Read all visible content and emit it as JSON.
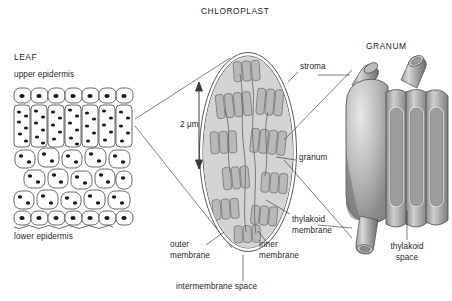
{
  "diagram": {
    "title_leaf": "LEAF",
    "title_chloroplast": "CHLOROPLAST",
    "title_granum": "GRANUM",
    "scale_label": "2 μm",
    "ink": "#1d1d1d",
    "fill_light": "#d9d9d9",
    "fill_mid": "#a8a8a8",
    "fill_dark": "#6e6e6e"
  },
  "leaf": {
    "upper_epidermis": "upper epidermis",
    "lower_epidermis": "lower epidermis"
  },
  "chloroplast": {
    "stroma": "stroma",
    "granum": "granum",
    "thylakoid_membrane": "thylakoid\nmembrane",
    "outer_membrane": "outer\nmembrane",
    "inner_membrane": "inner\nmembrane",
    "intermembrane_space": "intermembrane space"
  },
  "granum": {
    "thylakoid_space": "thylakoid\nspace"
  }
}
